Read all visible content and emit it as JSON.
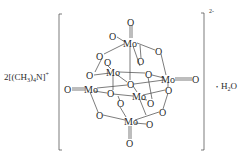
{
  "cation": {
    "prefix": "2[(CH",
    "sub": "3",
    "mid": ")",
    "sub2": "4",
    "suffix": "N]",
    "charge": "+"
  },
  "anion_charge": "2-",
  "hydrate": {
    "dot": "•",
    "prefix": "H",
    "sub": "2",
    "suffix": "O"
  },
  "atoms": {
    "mo": "Mo",
    "o": "O"
  },
  "structure": {
    "name": "hexamolybdate (Lindqvist) anion",
    "mo_count": 6,
    "terminal_oxo": 6
  }
}
